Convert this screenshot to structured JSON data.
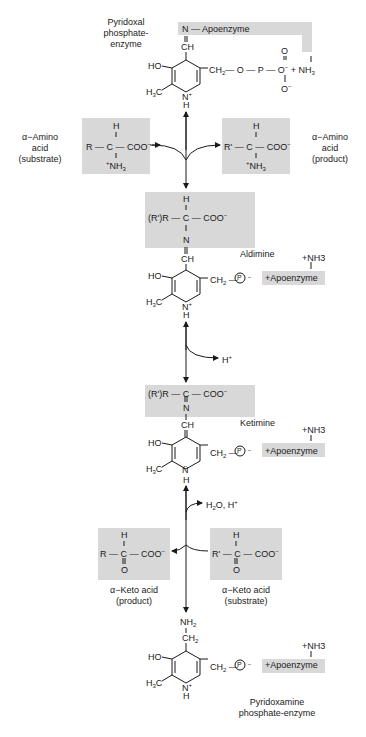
{
  "labels": {
    "plp_enzyme": [
      "Pyridoxal",
      "phosphate-",
      "enzyme"
    ],
    "amino_substrate": [
      "α−Amino",
      "acid",
      "(substrate)"
    ],
    "amino_product": [
      "α−Amino",
      "acid",
      "(product)"
    ],
    "aldimine": "Aldimine",
    "ketimine": "Ketimine",
    "keto_product": [
      "α−Keto acid",
      "(product)"
    ],
    "keto_substrate": [
      "α−Keto acid",
      "(substrate)"
    ],
    "pmp_enzyme": [
      "Pyridoxamine",
      "phosphate-enzyme"
    ]
  },
  "reagents": {
    "h_plus": "H+",
    "water_h_plus": "H2O, H+"
  },
  "groups": {
    "apoenzyme": "Apoenzyme",
    "apoenzyme_charged": "+Apoenzyme",
    "nh3_plus": "+NH3",
    "coo": "COO−",
    "phosphate": "P"
  },
  "colors": {
    "box_fill": "#d8d8d8",
    "ink": "#1a1a1a",
    "background": "#ffffff"
  }
}
